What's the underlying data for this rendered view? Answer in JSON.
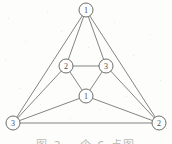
{
  "figure": {
    "kind": "undirected-graph-diagram",
    "background_color": "#fdfdfc",
    "edge_color": "#6e6f6b",
    "node_fill_color": "#fefefe",
    "node_stroke_color": "#5d5e5a",
    "label_color": "#4a4b48",
    "node_radius": 7
  },
  "caption": {
    "text": "图 2 一个 6 点图",
    "color": "#b9bab6",
    "visible": "partially cut off at bottom edge"
  },
  "chart_data": {
    "type": "graph",
    "title": "",
    "node_count": 6,
    "edge_count": 12,
    "nodes": [
      {
        "id": "top",
        "label": "1",
        "x": 86,
        "y": 10
      },
      {
        "id": "mid-left",
        "label": "2",
        "x": 66,
        "y": 66
      },
      {
        "id": "mid-right",
        "label": "3",
        "x": 106,
        "y": 66
      },
      {
        "id": "center",
        "label": "1",
        "x": 86,
        "y": 96
      },
      {
        "id": "bottom-left",
        "label": "3",
        "x": 13,
        "y": 123
      },
      {
        "id": "bottom-right",
        "label": "2",
        "x": 159,
        "y": 123
      }
    ],
    "edges": [
      {
        "from": "top",
        "to": "bottom-left"
      },
      {
        "from": "top",
        "to": "bottom-right"
      },
      {
        "from": "top",
        "to": "mid-left"
      },
      {
        "from": "top",
        "to": "mid-right"
      },
      {
        "from": "mid-left",
        "to": "mid-right"
      },
      {
        "from": "mid-left",
        "to": "center"
      },
      {
        "from": "mid-right",
        "to": "center"
      },
      {
        "from": "mid-left",
        "to": "bottom-left"
      },
      {
        "from": "mid-right",
        "to": "bottom-right"
      },
      {
        "from": "center",
        "to": "bottom-left"
      },
      {
        "from": "center",
        "to": "bottom-right"
      },
      {
        "from": "bottom-left",
        "to": "bottom-right"
      }
    ]
  }
}
